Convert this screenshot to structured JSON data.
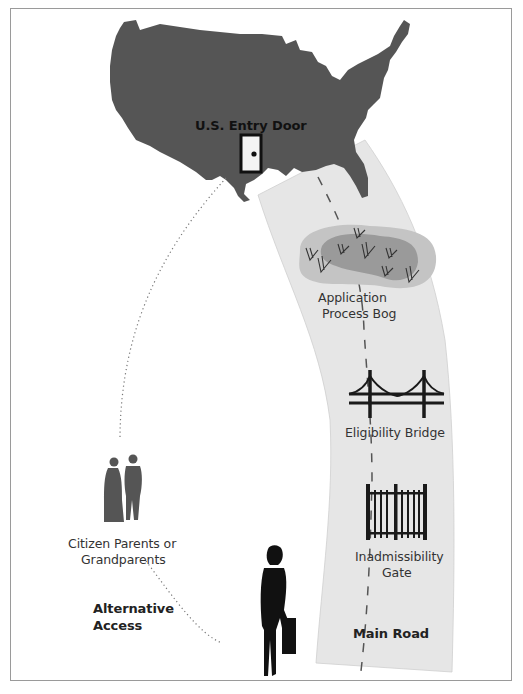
{
  "figure": {
    "labels": {
      "entry_door": "U.S. Entry Door",
      "bog_line1": "Application",
      "bog_line2": "Process Bog",
      "bridge": "Eligibility Bridge",
      "gate_line1": "Inadmissibility",
      "gate_line2": "Gate",
      "main_road": "Main Road",
      "parents_line1": "Citizen Parents or",
      "parents_line2": "Grandparents",
      "alt_line1": "Alternative",
      "alt_line2": "Access"
    },
    "icons": [
      "us-map",
      "entry-door-icon",
      "bog-grass-icon",
      "bridge-icon",
      "gate-icon",
      "woman-traveler-icon",
      "couple-silhouette-icon"
    ],
    "colors": {
      "map_fill": "#555555",
      "road_fill": "#e6e6e6",
      "bog_outer": "#c4c4c4",
      "bog_inner": "#9a9a9a",
      "frame": "#9a9a9a",
      "silhouette": "#111111",
      "couple": "#555555"
    }
  }
}
